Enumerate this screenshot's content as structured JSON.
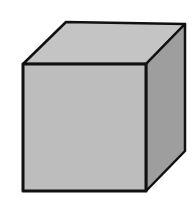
{
  "diagram": {
    "colors": {
      "background": "#ffffff",
      "top_face": "#c4c4c4",
      "front_face": "#bdbdbd",
      "side_face": "#9e9e9e",
      "outline": "#111111"
    },
    "faces": {
      "top": "66,22 185,24 146,64 23,64",
      "front": "23,64 146,64 146,191 23,191",
      "side": "146,64 185,24 185,151 146,191"
    }
  }
}
